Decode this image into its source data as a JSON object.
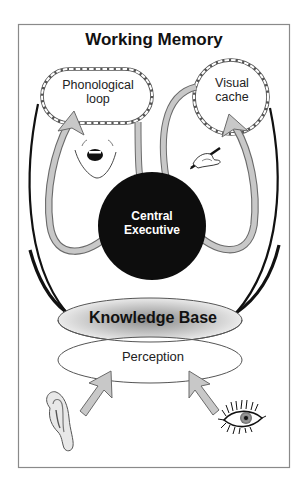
{
  "diagram": {
    "title": "Working Memory",
    "components": {
      "phonological_loop": {
        "line1": "Phonological",
        "line2": "loop"
      },
      "visual_cache": {
        "line1": "Visual",
        "line2": "cache"
      },
      "central_executive": {
        "line1": "Central",
        "line2": "Executive"
      },
      "knowledge_base": {
        "label": "Knowledge Base"
      },
      "perception": {
        "label": "Perception"
      }
    },
    "icons": {
      "mouth": "mouth-icon",
      "writing_hand": "writing-hand-icon",
      "ear": "ear-icon",
      "eye": "eye-icon"
    },
    "colors": {
      "frame": "#8a8a8a",
      "arrow_fill": "#c8c8c8",
      "arrow_stroke": "#6a6a6a",
      "central_executive": "#0d0d0d",
      "outline": "#111111",
      "knowledge_base_shade": "#9a9a9a"
    }
  }
}
